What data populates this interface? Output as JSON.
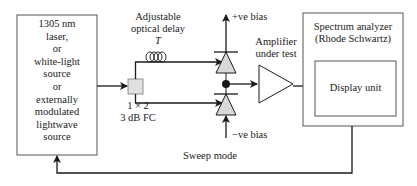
{
  "source": {
    "lines": [
      "1305 nm",
      "laser,",
      "or",
      "white-light",
      "source",
      "or",
      "externally",
      "modulated",
      "lightwave",
      "source"
    ]
  },
  "delay": {
    "line1": "Adjustable",
    "line2": "optical delay",
    "symbol": "T"
  },
  "coupler": {
    "line1": "1 × 2",
    "line2": "3 dB FC"
  },
  "bias": {
    "positive": "+ve bias",
    "negative": "−ve bias"
  },
  "amplifier": {
    "line1": "Amplifier",
    "line2": "under test"
  },
  "analyzer": {
    "line1": "Spectrum analyzer",
    "line2": "(Rhode Schwartz)",
    "display": "Display unit"
  },
  "feedback": {
    "label": "Sweep mode"
  },
  "colors": {
    "line": "#1a1a1a",
    "box_border": "#555555",
    "fill_gray": "#d9d9d9"
  }
}
